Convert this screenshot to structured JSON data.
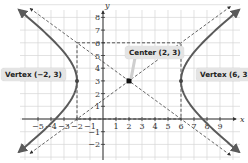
{
  "chart_data": {
    "type": "line",
    "title": "",
    "xlabel": "x",
    "ylabel": "y",
    "xlim": [
      -6,
      10
    ],
    "ylim": [
      -3,
      9
    ],
    "grid": true,
    "legend": null,
    "x_ticks": [
      -5,
      -4,
      -3,
      -2,
      -1,
      1,
      2,
      3,
      4,
      5,
      6,
      7,
      8,
      9
    ],
    "y_ticks": [
      -2,
      -1,
      1,
      2,
      3,
      4,
      5,
      6,
      7,
      8
    ],
    "x_tick_labels": [
      "−5",
      "−4",
      "−3",
      "−2",
      "−1",
      "1",
      "2",
      "3",
      "4",
      "5",
      "6",
      "7",
      "8",
      "9"
    ],
    "y_tick_labels": [
      "−2",
      "−1",
      "1",
      "2",
      "3",
      "4",
      "5",
      "6",
      "7",
      "8"
    ],
    "equation": "(x-2)^2/16 - (y-3)^2/9 = 1",
    "center": [
      2,
      3
    ],
    "a": 4,
    "b": 3,
    "vertices": [
      [
        -2,
        3
      ],
      [
        6,
        3
      ]
    ],
    "asymptotes": [
      {
        "name": "asymptote-positive",
        "slope": 0.75,
        "through": [
          2,
          3
        ],
        "style": "dashed"
      },
      {
        "name": "asymptote-negative",
        "slope": -0.75,
        "through": [
          2,
          3
        ],
        "style": "dashed"
      }
    ],
    "fundamental_rectangle": {
      "x": [
        -2,
        6
      ],
      "y": [
        0,
        6
      ],
      "style": "dashed"
    },
    "series": [
      {
        "name": "hyperbola-left-branch",
        "color": "#555555",
        "style": "solid"
      },
      {
        "name": "hyperbola-right-branch",
        "color": "#555555",
        "style": "solid"
      }
    ],
    "annotations": [
      {
        "label": "Vertex (−2, 3)",
        "point": [
          -2,
          3
        ]
      },
      {
        "label": "Center (2, 3)",
        "point": [
          2,
          3
        ]
      },
      {
        "label": "Vertex (6, 3)",
        "point": [
          6,
          3
        ]
      }
    ]
  },
  "labels": {
    "x_axis": "x",
    "y_axis": "y",
    "vertex_left": "Vertex (−2, 3)",
    "center": "Center (2, 3)",
    "vertex_right": "Vertex (6, 3)"
  },
  "colors": {
    "grid": "#d6d6d6",
    "axis": "#333333",
    "curve": "#5a5a5a",
    "dashed": "#555555",
    "callout_bg": "#e4e4e4"
  }
}
